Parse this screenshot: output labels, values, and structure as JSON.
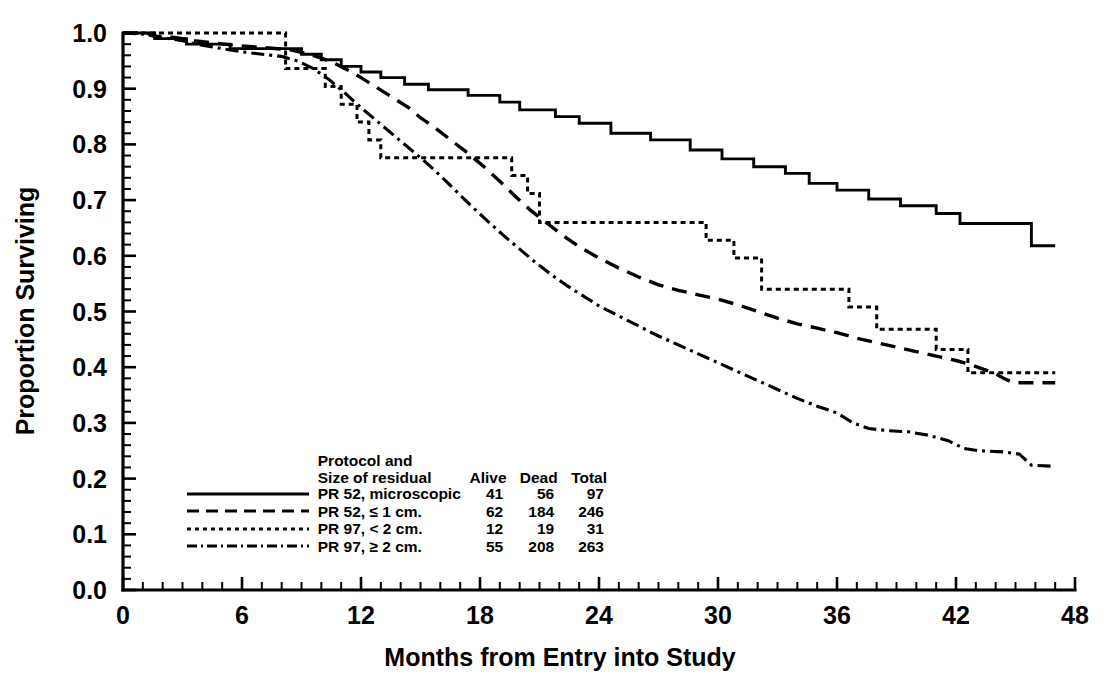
{
  "axes": {
    "xlabel": "Months from Entry into Study",
    "ylabel": "Proportion Surviving",
    "xticks": [
      "0",
      "6",
      "12",
      "18",
      "24",
      "30",
      "36",
      "42",
      "48"
    ],
    "yticks": [
      "1.0",
      "0.9",
      "0.8",
      "0.7",
      "0.6",
      "0.5",
      "0.4",
      "0.3",
      "0.2",
      "0.1",
      "0.0"
    ]
  },
  "legend": {
    "title_line1": "Protocol and",
    "title_line2": "Size of residual",
    "col_alive": "Alive",
    "col_dead": "Dead",
    "col_total": "Total",
    "rows": [
      {
        "label": "PR 52, microscopic",
        "alive": "41",
        "dead": "56",
        "total": "97",
        "style": "solid"
      },
      {
        "label": "PR 52, ≤ 1 cm.",
        "alive": "62",
        "dead": "184",
        "total": "246",
        "style": "dashed"
      },
      {
        "label": "PR 97, < 2 cm.",
        "alive": "12",
        "dead": "19",
        "total": "31",
        "style": "dotted"
      },
      {
        "label": "PR 97, ≥ 2 cm.",
        "alive": "55",
        "dead": "208",
        "total": "263",
        "style": "dashdot"
      }
    ]
  },
  "chart_data": {
    "type": "line",
    "subtype": "kaplan-meier-step",
    "title": "",
    "xlabel": "Months from Entry into Study",
    "ylabel": "Proportion Surviving",
    "xlim": [
      0,
      48
    ],
    "ylim": [
      0.0,
      1.0
    ],
    "xtick_step": 6,
    "xminor_step": 1,
    "ytick_step": 0.1,
    "grid": false,
    "legend_position": "lower-left-inside",
    "accent_color": "#000000",
    "background_color": "#ffffff",
    "series": [
      {
        "name": "PR 52, microscopic",
        "style": "solid",
        "alive": 41,
        "dead": 56,
        "total": 97,
        "points": [
          [
            0.0,
            1.0
          ],
          [
            1.6,
            1.0
          ],
          [
            1.6,
            0.99
          ],
          [
            3.2,
            0.99
          ],
          [
            3.2,
            0.98
          ],
          [
            5.4,
            0.98
          ],
          [
            5.4,
            0.972
          ],
          [
            9.0,
            0.972
          ],
          [
            9.0,
            0.962
          ],
          [
            10.0,
            0.962
          ],
          [
            10.0,
            0.952
          ],
          [
            11.0,
            0.952
          ],
          [
            11.0,
            0.94
          ],
          [
            12.0,
            0.94
          ],
          [
            12.0,
            0.93
          ],
          [
            13.0,
            0.93
          ],
          [
            13.0,
            0.92
          ],
          [
            14.2,
            0.92
          ],
          [
            14.2,
            0.908
          ],
          [
            15.4,
            0.908
          ],
          [
            15.4,
            0.898
          ],
          [
            17.4,
            0.898
          ],
          [
            17.4,
            0.888
          ],
          [
            19.0,
            0.888
          ],
          [
            19.0,
            0.876
          ],
          [
            20.0,
            0.876
          ],
          [
            20.0,
            0.862
          ],
          [
            21.8,
            0.862
          ],
          [
            21.8,
            0.85
          ],
          [
            23.0,
            0.85
          ],
          [
            23.0,
            0.838
          ],
          [
            24.6,
            0.838
          ],
          [
            24.6,
            0.82
          ],
          [
            26.6,
            0.82
          ],
          [
            26.6,
            0.808
          ],
          [
            28.6,
            0.808
          ],
          [
            28.6,
            0.79
          ],
          [
            30.2,
            0.79
          ],
          [
            30.2,
            0.774
          ],
          [
            31.8,
            0.774
          ],
          [
            31.8,
            0.76
          ],
          [
            33.4,
            0.76
          ],
          [
            33.4,
            0.748
          ],
          [
            34.6,
            0.748
          ],
          [
            34.6,
            0.73
          ],
          [
            36.0,
            0.73
          ],
          [
            36.0,
            0.718
          ],
          [
            37.6,
            0.718
          ],
          [
            37.6,
            0.702
          ],
          [
            39.2,
            0.702
          ],
          [
            39.2,
            0.69
          ],
          [
            41.0,
            0.69
          ],
          [
            41.0,
            0.676
          ],
          [
            42.2,
            0.676
          ],
          [
            42.2,
            0.658
          ],
          [
            45.8,
            0.658
          ],
          [
            45.8,
            0.618
          ],
          [
            47.0,
            0.618
          ]
        ]
      },
      {
        "name": "PR 52, ≤ 1 cm.",
        "style": "dashed",
        "alive": 62,
        "dead": 184,
        "total": 246,
        "points": [
          [
            0.0,
            1.0
          ],
          [
            1.2,
            1.0
          ],
          [
            1.6,
            0.994
          ],
          [
            2.6,
            0.992
          ],
          [
            3.6,
            0.986
          ],
          [
            4.6,
            0.982
          ],
          [
            5.6,
            0.978
          ],
          [
            7.0,
            0.974
          ],
          [
            8.4,
            0.97
          ],
          [
            9.4,
            0.962
          ],
          [
            10.4,
            0.95
          ],
          [
            11.2,
            0.936
          ],
          [
            12.0,
            0.92
          ],
          [
            12.8,
            0.902
          ],
          [
            13.6,
            0.884
          ],
          [
            14.4,
            0.866
          ],
          [
            15.0,
            0.848
          ],
          [
            15.8,
            0.828
          ],
          [
            16.6,
            0.806
          ],
          [
            17.4,
            0.784
          ],
          [
            18.2,
            0.76
          ],
          [
            19.0,
            0.734
          ],
          [
            19.8,
            0.706
          ],
          [
            20.6,
            0.68
          ],
          [
            21.4,
            0.658
          ],
          [
            22.2,
            0.636
          ],
          [
            23.0,
            0.616
          ],
          [
            24.0,
            0.596
          ],
          [
            25.0,
            0.578
          ],
          [
            26.0,
            0.562
          ],
          [
            27.0,
            0.548
          ],
          [
            28.0,
            0.538
          ],
          [
            29.0,
            0.53
          ],
          [
            30.0,
            0.522
          ],
          [
            31.0,
            0.512
          ],
          [
            32.0,
            0.5
          ],
          [
            33.0,
            0.488
          ],
          [
            34.0,
            0.478
          ],
          [
            35.0,
            0.47
          ],
          [
            36.0,
            0.462
          ],
          [
            37.0,
            0.452
          ],
          [
            38.0,
            0.444
          ],
          [
            39.0,
            0.436
          ],
          [
            40.0,
            0.428
          ],
          [
            41.0,
            0.42
          ],
          [
            42.0,
            0.412
          ],
          [
            42.8,
            0.404
          ],
          [
            43.4,
            0.396
          ],
          [
            43.9,
            0.39
          ],
          [
            44.4,
            0.38
          ],
          [
            44.9,
            0.372
          ],
          [
            47.0,
            0.372
          ]
        ]
      },
      {
        "name": "PR 97, < 2 cm.",
        "style": "dotted",
        "alive": 12,
        "dead": 19,
        "total": 31,
        "points": [
          [
            0.0,
            1.0
          ],
          [
            8.2,
            1.0
          ],
          [
            8.2,
            0.936
          ],
          [
            10.2,
            0.936
          ],
          [
            10.2,
            0.904
          ],
          [
            11.0,
            0.904
          ],
          [
            11.0,
            0.872
          ],
          [
            11.8,
            0.872
          ],
          [
            11.8,
            0.84
          ],
          [
            12.4,
            0.84
          ],
          [
            12.4,
            0.808
          ],
          [
            13.0,
            0.808
          ],
          [
            13.0,
            0.776
          ],
          [
            19.6,
            0.776
          ],
          [
            19.6,
            0.744
          ],
          [
            20.4,
            0.744
          ],
          [
            20.4,
            0.712
          ],
          [
            21.0,
            0.712
          ],
          [
            21.0,
            0.66
          ],
          [
            29.4,
            0.66
          ],
          [
            29.4,
            0.628
          ],
          [
            30.8,
            0.628
          ],
          [
            30.8,
            0.596
          ],
          [
            32.2,
            0.596
          ],
          [
            32.2,
            0.54
          ],
          [
            36.6,
            0.54
          ],
          [
            36.6,
            0.508
          ],
          [
            38.0,
            0.508
          ],
          [
            38.0,
            0.468
          ],
          [
            41.0,
            0.468
          ],
          [
            41.0,
            0.432
          ],
          [
            42.6,
            0.432
          ],
          [
            42.6,
            0.39
          ],
          [
            47.0,
            0.39
          ]
        ]
      },
      {
        "name": "PR 97, ≥ 2 cm.",
        "style": "dashdot",
        "alive": 55,
        "dead": 208,
        "total": 263,
        "points": [
          [
            0.0,
            1.0
          ],
          [
            1.0,
            0.998
          ],
          [
            2.0,
            0.992
          ],
          [
            3.0,
            0.986
          ],
          [
            4.0,
            0.978
          ],
          [
            5.0,
            0.972
          ],
          [
            6.0,
            0.966
          ],
          [
            7.0,
            0.962
          ],
          [
            8.0,
            0.958
          ],
          [
            8.8,
            0.95
          ],
          [
            9.6,
            0.936
          ],
          [
            10.4,
            0.916
          ],
          [
            11.2,
            0.892
          ],
          [
            12.0,
            0.866
          ],
          [
            12.8,
            0.842
          ],
          [
            13.6,
            0.818
          ],
          [
            14.4,
            0.794
          ],
          [
            15.2,
            0.77
          ],
          [
            16.0,
            0.744
          ],
          [
            16.8,
            0.716
          ],
          [
            17.6,
            0.688
          ],
          [
            18.4,
            0.662
          ],
          [
            19.2,
            0.636
          ],
          [
            20.0,
            0.612
          ],
          [
            20.8,
            0.588
          ],
          [
            21.6,
            0.566
          ],
          [
            22.4,
            0.546
          ],
          [
            23.2,
            0.528
          ],
          [
            24.0,
            0.51
          ],
          [
            25.0,
            0.492
          ],
          [
            26.0,
            0.474
          ],
          [
            27.0,
            0.456
          ],
          [
            28.0,
            0.44
          ],
          [
            29.0,
            0.424
          ],
          [
            30.0,
            0.408
          ],
          [
            31.0,
            0.392
          ],
          [
            32.0,
            0.376
          ],
          [
            33.0,
            0.36
          ],
          [
            34.0,
            0.344
          ],
          [
            35.0,
            0.33
          ],
          [
            36.0,
            0.318
          ],
          [
            36.8,
            0.3
          ],
          [
            37.6,
            0.29
          ],
          [
            38.6,
            0.286
          ],
          [
            39.6,
            0.284
          ],
          [
            40.6,
            0.278
          ],
          [
            41.6,
            0.268
          ],
          [
            42.4,
            0.254
          ],
          [
            43.2,
            0.25
          ],
          [
            44.4,
            0.248
          ],
          [
            45.2,
            0.244
          ],
          [
            45.8,
            0.224
          ],
          [
            47.0,
            0.222
          ]
        ]
      }
    ]
  }
}
